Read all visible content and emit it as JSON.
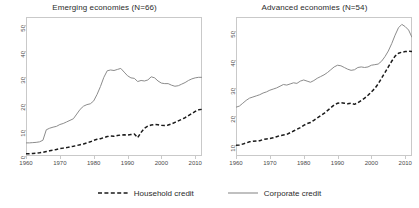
{
  "figure": {
    "legend": {
      "items": [
        {
          "label": "Household credit",
          "style": "dashed",
          "color": "#1a1a1a"
        },
        {
          "label": "Corporate credit",
          "style": "solid",
          "color": "#8c8c8c"
        }
      ]
    }
  },
  "chart_data": [
    {
      "type": "line",
      "title": "Emerging economies (N=66)",
      "xlabel": "",
      "ylabel": "",
      "xlim": [
        1960,
        2012
      ],
      "ylim": [
        0,
        53
      ],
      "xticks": [
        1960,
        1970,
        1980,
        1990,
        2000,
        2010
      ],
      "yticks": [
        0,
        10,
        20,
        30,
        40,
        50
      ],
      "grid": false,
      "legend_position": "below-figure",
      "series": [
        {
          "name": "Corporate credit",
          "style": "solid",
          "color": "#8c8c8c",
          "x": [
            1960,
            1961,
            1962,
            1963,
            1964,
            1965,
            1966,
            1967,
            1968,
            1969,
            1970,
            1971,
            1972,
            1973,
            1974,
            1975,
            1976,
            1977,
            1978,
            1979,
            1980,
            1981,
            1982,
            1983,
            1984,
            1985,
            1986,
            1987,
            1988,
            1989,
            1990,
            1991,
            1992,
            1993,
            1994,
            1995,
            1996,
            1997,
            1998,
            1999,
            2000,
            2001,
            2002,
            2003,
            2004,
            2005,
            2006,
            2007,
            2008,
            2009,
            2010,
            2011,
            2012
          ],
          "values": [
            5.0,
            5.0,
            5.1,
            5.2,
            5.4,
            6.0,
            10.0,
            10.6,
            11.0,
            11.3,
            12.0,
            12.4,
            13.0,
            13.6,
            14.2,
            16.0,
            17.8,
            19.0,
            19.6,
            19.9,
            21.0,
            23.5,
            26.5,
            30.0,
            32.5,
            32.8,
            32.6,
            33.0,
            33.4,
            32.0,
            30.6,
            29.8,
            29.6,
            28.4,
            28.8,
            28.6,
            29.0,
            30.2,
            29.8,
            28.6,
            27.8,
            27.6,
            27.6,
            27.0,
            26.6,
            26.8,
            27.4,
            28.0,
            28.8,
            29.4,
            29.8,
            30.0,
            30.0
          ]
        },
        {
          "name": "Household credit",
          "style": "dashed",
          "color": "#1a1a1a",
          "x": [
            1960,
            1961,
            1962,
            1963,
            1964,
            1965,
            1966,
            1967,
            1968,
            1969,
            1970,
            1971,
            1972,
            1973,
            1974,
            1975,
            1976,
            1977,
            1978,
            1979,
            1980,
            1981,
            1982,
            1983,
            1984,
            1985,
            1986,
            1987,
            1988,
            1989,
            1990,
            1991,
            1992,
            1993,
            1994,
            1995,
            1996,
            1997,
            1998,
            1999,
            2000,
            2001,
            2002,
            2003,
            2004,
            2005,
            2006,
            2007,
            2008,
            2009,
            2010,
            2011,
            2012
          ],
          "values": [
            0.9,
            0.9,
            1.0,
            1.1,
            1.2,
            1.4,
            1.7,
            2.0,
            2.2,
            2.5,
            2.8,
            3.0,
            3.2,
            3.5,
            3.7,
            4.0,
            4.3,
            4.6,
            5.0,
            5.4,
            6.0,
            6.4,
            6.6,
            7.0,
            7.4,
            7.6,
            7.5,
            7.8,
            8.0,
            8.1,
            8.0,
            8.2,
            8.4,
            7.0,
            9.0,
            10.6,
            11.4,
            11.8,
            12.0,
            11.9,
            11.7,
            11.6,
            11.8,
            12.2,
            12.8,
            13.4,
            14.0,
            14.6,
            15.4,
            16.2,
            17.0,
            17.6,
            17.8
          ]
        }
      ]
    },
    {
      "type": "line",
      "title": "Advanced economies (N=54)",
      "xlabel": "",
      "ylabel": "",
      "xlim": [
        1960,
        2012
      ],
      "ylim": [
        6,
        55
      ],
      "xticks": [
        1960,
        1970,
        1980,
        1990,
        2000,
        2010
      ],
      "yticks": [
        10,
        20,
        30,
        40,
        50
      ],
      "grid": false,
      "legend_position": "below-figure",
      "series": [
        {
          "name": "Corporate credit",
          "style": "solid",
          "color": "#8c8c8c",
          "x": [
            1960,
            1961,
            1962,
            1963,
            1964,
            1965,
            1966,
            1967,
            1968,
            1969,
            1970,
            1971,
            1972,
            1973,
            1974,
            1975,
            1976,
            1977,
            1978,
            1979,
            1980,
            1981,
            1982,
            1983,
            1984,
            1985,
            1986,
            1987,
            1988,
            1989,
            1990,
            1991,
            1992,
            1993,
            1994,
            1995,
            1996,
            1997,
            1998,
            1999,
            2000,
            2001,
            2002,
            2003,
            2004,
            2005,
            2006,
            2007,
            2008,
            2009,
            2010,
            2011,
            2012
          ],
          "values": [
            23.2,
            23.6,
            24.6,
            25.6,
            26.4,
            26.8,
            27.2,
            27.6,
            28.2,
            28.6,
            29.2,
            29.6,
            30.0,
            30.6,
            31.2,
            31.0,
            31.4,
            31.8,
            31.6,
            32.4,
            32.8,
            32.4,
            32.0,
            32.6,
            33.4,
            34.0,
            34.6,
            35.4,
            36.4,
            37.4,
            38.0,
            37.8,
            37.2,
            36.6,
            36.2,
            36.4,
            37.2,
            37.4,
            37.2,
            37.4,
            38.0,
            38.2,
            38.4,
            39.4,
            41.0,
            43.0,
            45.6,
            48.6,
            51.2,
            52.4,
            51.6,
            50.4,
            47.8
          ]
        },
        {
          "name": "Household credit",
          "style": "dashed",
          "color": "#1a1a1a",
          "x": [
            1960,
            1961,
            1962,
            1963,
            1964,
            1965,
            1966,
            1967,
            1968,
            1969,
            1970,
            1971,
            1972,
            1973,
            1974,
            1975,
            1976,
            1977,
            1978,
            1979,
            1980,
            1981,
            1982,
            1983,
            1984,
            1985,
            1986,
            1987,
            1988,
            1989,
            1990,
            1991,
            1992,
            1993,
            1994,
            1995,
            1996,
            1997,
            1998,
            1999,
            2000,
            2001,
            2002,
            2003,
            2004,
            2005,
            2006,
            2007,
            2008,
            2009,
            2010,
            2011,
            2012
          ],
          "values": [
            9.8,
            9.9,
            10.2,
            10.6,
            11.0,
            11.2,
            11.3,
            11.4,
            11.8,
            12.0,
            12.2,
            12.4,
            12.8,
            13.2,
            13.4,
            13.6,
            14.2,
            14.8,
            15.4,
            16.0,
            16.8,
            17.4,
            17.8,
            18.6,
            19.4,
            20.2,
            21.0,
            22.0,
            23.0,
            24.0,
            24.6,
            24.8,
            24.6,
            24.4,
            24.6,
            24.2,
            24.8,
            25.6,
            26.4,
            27.4,
            28.6,
            29.8,
            31.4,
            33.4,
            35.4,
            37.4,
            39.4,
            41.2,
            42.2,
            42.6,
            42.8,
            42.9,
            42.8
          ]
        }
      ]
    }
  ]
}
